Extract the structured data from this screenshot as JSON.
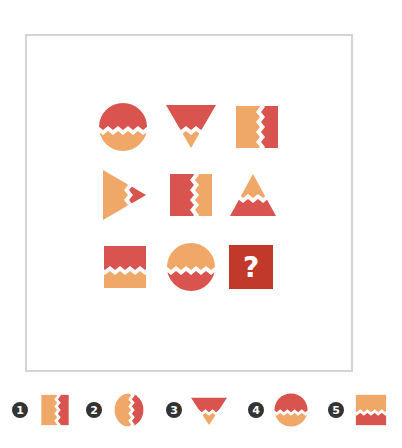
{
  "puzzle": {
    "grid": [
      {
        "row": 1,
        "col": 1,
        "shape": "circle",
        "split": "horizontal",
        "top": "red",
        "bottom": "orange"
      },
      {
        "row": 1,
        "col": 2,
        "shape": "triangle-down",
        "split": "horizontal",
        "top": "red",
        "bottom": "orange"
      },
      {
        "row": 1,
        "col": 3,
        "shape": "square",
        "split": "vertical",
        "left": "orange",
        "right": "red"
      },
      {
        "row": 2,
        "col": 1,
        "shape": "triangle-right",
        "split": "vertical",
        "left": "orange",
        "right": "red"
      },
      {
        "row": 2,
        "col": 2,
        "shape": "square",
        "split": "vertical",
        "left": "red",
        "right": "orange"
      },
      {
        "row": 2,
        "col": 3,
        "shape": "triangle-up",
        "split": "horizontal",
        "top": "orange",
        "bottom": "red"
      },
      {
        "row": 3,
        "col": 1,
        "shape": "square",
        "split": "horizontal",
        "top": "red",
        "bottom": "orange"
      },
      {
        "row": 3,
        "col": 2,
        "shape": "circle",
        "split": "horizontal",
        "top": "orange",
        "bottom": "red"
      },
      {
        "row": 3,
        "col": 3,
        "shape": "unknown",
        "label": "?"
      }
    ],
    "question_mark": "?"
  },
  "options": [
    {
      "number": "1",
      "shape": "square",
      "split": "vertical",
      "left": "orange",
      "right": "red"
    },
    {
      "number": "2",
      "shape": "circle",
      "split": "vertical",
      "left": "orange",
      "right": "red"
    },
    {
      "number": "3",
      "shape": "triangle-down",
      "split": "horizontal",
      "top": "red",
      "bottom": "orange"
    },
    {
      "number": "4",
      "shape": "circle",
      "split": "horizontal",
      "top": "red",
      "bottom": "orange"
    },
    {
      "number": "5",
      "shape": "square",
      "split": "horizontal",
      "top": "orange",
      "bottom": "red"
    }
  ],
  "colors": {
    "red": "#d9534f",
    "orange": "#f0a868",
    "frame": "#d4d4d4",
    "question_tile": "#c0392b",
    "badge": "#333333"
  }
}
